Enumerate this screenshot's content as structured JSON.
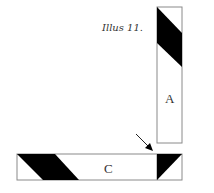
{
  "caption": "Illus 11.",
  "labels": {
    "a": "A",
    "c": "C"
  },
  "colors": {
    "stroke": "#8a8a8a",
    "fill_dark": "#000000",
    "background": "#ffffff",
    "text": "#333333"
  },
  "pieces": [
    {
      "id": "A",
      "orientation": "vertical",
      "description": "vertical strip with dark diagonal band at top"
    },
    {
      "id": "C",
      "orientation": "horizontal",
      "description": "horizontal strip with dark parallelogram at left and half-square triangle at right"
    }
  ],
  "annotation": {
    "type": "arrow",
    "points_to": "junction of strip C right square"
  }
}
